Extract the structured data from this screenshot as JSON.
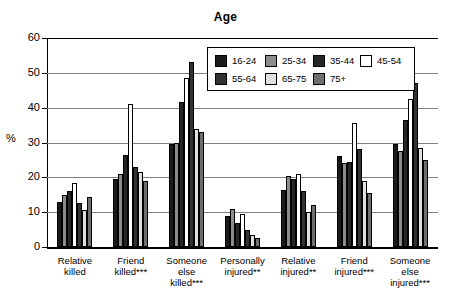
{
  "chart_data": {
    "type": "bar",
    "title": "Age",
    "xlabel": "",
    "ylabel": "%",
    "ylim": [
      0,
      60
    ],
    "yticks": [
      0,
      10,
      20,
      30,
      40,
      50,
      60
    ],
    "grid": true,
    "legend_position": "inside-top-center",
    "categories": [
      "Relative\nkilled",
      "Friend\nkilled***",
      "Someone\nelse\nkilled***",
      "Personally\ninjured**",
      "Relative\ninjured**",
      "Friend\ninjured***",
      "Someone\nelse\ninjured***"
    ],
    "series": [
      {
        "name": "16-24",
        "color": "#1a1a1a",
        "values": [
          13.0,
          19.5,
          29.5,
          9.0,
          16.5,
          26.0,
          29.5
        ]
      },
      {
        "name": "25-34",
        "color": "#8c8c8c",
        "values": [
          15.0,
          21.0,
          30.0,
          11.0,
          20.5,
          24.0,
          27.5
        ]
      },
      {
        "name": "35-44",
        "color": "#262626",
        "values": [
          16.0,
          26.5,
          41.5,
          7.0,
          19.5,
          24.5,
          36.5
        ]
      },
      {
        "name": "45-54",
        "color": "#ffffff",
        "values": [
          18.5,
          41.0,
          48.5,
          9.5,
          21.0,
          35.5,
          42.5
        ]
      },
      {
        "name": "55-64",
        "color": "#333333",
        "values": [
          12.5,
          23.0,
          53.0,
          5.0,
          16.0,
          28.0,
          47.0
        ]
      },
      {
        "name": "65-75",
        "color": "#e0e0e0",
        "values": [
          10.5,
          21.5,
          34.0,
          3.5,
          10.0,
          19.0,
          28.5
        ]
      },
      {
        "name": "75+",
        "color": "#6e6e6e",
        "values": [
          14.5,
          19.0,
          33.0,
          2.5,
          12.0,
          15.5,
          25.0
        ]
      }
    ]
  },
  "legend": {
    "entries": [
      {
        "label": "16-24"
      },
      {
        "label": "25-34"
      },
      {
        "label": "35-44"
      },
      {
        "label": "45-54"
      },
      {
        "label": "55-64"
      },
      {
        "label": "65-75"
      },
      {
        "label": "75+"
      }
    ]
  }
}
